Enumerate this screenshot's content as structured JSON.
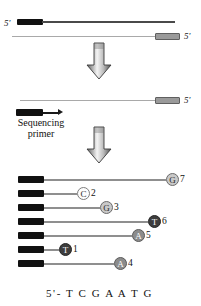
{
  "figure": {
    "title_text": "",
    "sequence_readout": "5'- T C G A A T G",
    "primer_label_line1": "Sequencing",
    "primer_label_line2": "primer",
    "five_prime_top_left": "5'",
    "five_prime_top_right": "5'",
    "five_prime_mid_right": "5'",
    "colors": {
      "black": "#111111",
      "dark_strand": "#4a4a4a",
      "thin_strand": "#a9a9a9",
      "gray_box_fill": "#9a9a9a",
      "gray_box_border": "#5f5f5f",
      "ladder_line": "#8f8f8f",
      "arrow_dark": "#4d4d4d",
      "arrow_light": "#f2f2f2"
    }
  },
  "top_duplex": {
    "top_strand_five_prime": "5'",
    "bottom_strand_five_prime": "5'"
  },
  "middle_template": {
    "five_prime": "5'",
    "primer_label": "Sequencing primer"
  },
  "arrows": [
    {
      "name": "reaction-arrow-1",
      "direction": "down"
    },
    {
      "name": "reaction-arrow-2",
      "direction": "down"
    }
  ],
  "ladder": {
    "rows": [
      {
        "base": "G",
        "number": "7",
        "line_length": 122,
        "style": "light",
        "bar_width": 26
      },
      {
        "base": "C",
        "number": "2",
        "line_length": 33,
        "style": "white",
        "bar_width": 26
      },
      {
        "base": "G",
        "number": "3",
        "line_length": 56,
        "style": "light",
        "bar_width": 26
      },
      {
        "base": "T",
        "number": "6",
        "line_length": 104,
        "style": "dark",
        "bar_width": 26
      },
      {
        "base": "A",
        "number": "5",
        "line_length": 88,
        "style": "medium",
        "bar_width": 26
      },
      {
        "base": "T",
        "number": "1",
        "line_length": 15,
        "style": "dark",
        "bar_width": 26
      },
      {
        "base": "A",
        "number": "4",
        "line_length": 70,
        "style": "medium",
        "bar_width": 26
      }
    ]
  },
  "footer": {
    "sequence": "5'- T C G A A T G"
  }
}
